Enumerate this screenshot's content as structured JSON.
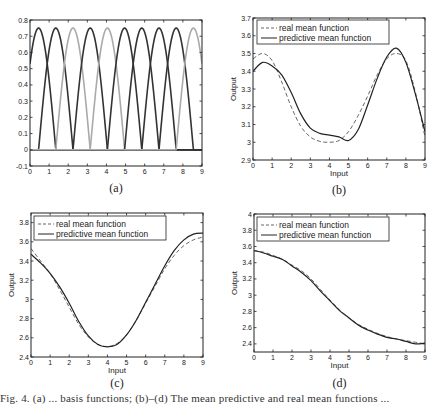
{
  "figure": {
    "caption_partial": "Fig. 4. (a) ... basis functions; (b)–(d) The mean predictive and real mean functions ...",
    "colors": {
      "axis": "#222222",
      "dark_curve": "#333333",
      "light_curve": "#aaaaaa",
      "real": "#666666",
      "pred": "#222222"
    }
  },
  "chart_data": [
    {
      "id": "a",
      "type": "line",
      "panel_label": "(a)",
      "title": "",
      "xlabel": "",
      "ylabel": "",
      "xlim": [
        0,
        9
      ],
      "ylim": [
        -0.1,
        0.8
      ],
      "xticks": [
        0,
        1,
        2,
        3,
        4,
        5,
        6,
        7,
        8,
        9
      ],
      "yticks": [
        -0.1,
        0,
        0.1,
        0.2,
        0.3,
        0.4,
        0.5,
        0.6,
        0.7,
        0.8
      ],
      "ytick_labels": [
        "-0.1",
        "0",
        "0.1",
        "0.2",
        "0.3",
        "0.4",
        "0.5",
        "0.6",
        "0.7",
        "0.8"
      ],
      "grid": false,
      "legend": null,
      "description": "Ten overlapping bell-shaped basis functions (half-cosine bumps), peak 0.75, width ~1.8, zero outside support",
      "series": [
        {
          "name": "basis-1",
          "center": 0.45,
          "peak": 0.75,
          "width": 1.8,
          "shade": "dark"
        },
        {
          "name": "basis-2",
          "center": 1.35,
          "peak": 0.75,
          "width": 1.8,
          "shade": "dark"
        },
        {
          "name": "basis-3",
          "center": 2.25,
          "peak": 0.75,
          "width": 1.8,
          "shade": "light"
        },
        {
          "name": "basis-4",
          "center": 3.15,
          "peak": 0.75,
          "width": 1.8,
          "shade": "dark"
        },
        {
          "name": "basis-5",
          "center": 4.05,
          "peak": 0.75,
          "width": 1.8,
          "shade": "light"
        },
        {
          "name": "basis-6",
          "center": 4.95,
          "peak": 0.75,
          "width": 1.8,
          "shade": "dark"
        },
        {
          "name": "basis-7",
          "center": 5.85,
          "peak": 0.75,
          "width": 1.8,
          "shade": "dark"
        },
        {
          "name": "basis-8",
          "center": 6.75,
          "peak": 0.75,
          "width": 1.8,
          "shade": "dark"
        },
        {
          "name": "basis-9",
          "center": 7.65,
          "peak": 0.75,
          "width": 1.8,
          "shade": "dark"
        },
        {
          "name": "basis-10",
          "center": 8.55,
          "peak": 0.75,
          "width": 1.8,
          "shade": "light"
        }
      ]
    },
    {
      "id": "b",
      "type": "line",
      "panel_label": "(b)",
      "title": "",
      "xlabel": "Input",
      "ylabel": "Output",
      "xlim": [
        0,
        9
      ],
      "ylim": [
        2.9,
        3.7
      ],
      "xticks": [
        0,
        1,
        2,
        3,
        4,
        5,
        6,
        7,
        8,
        9
      ],
      "yticks": [
        2.9,
        3.0,
        3.1,
        3.2,
        3.3,
        3.4,
        3.5,
        3.6,
        3.7
      ],
      "ytick_labels": [
        "2.9",
        "3",
        "3.1",
        "3.2",
        "3.3",
        "3.4",
        "3.5",
        "3.6",
        "3.7"
      ],
      "grid": false,
      "legend": {
        "position": "upper left",
        "entries": [
          "real mean function",
          "predictive mean function"
        ]
      },
      "x": [
        0,
        0.5,
        1,
        1.5,
        2,
        2.5,
        3,
        3.5,
        4,
        4.5,
        5,
        5.5,
        6,
        6.5,
        7,
        7.5,
        8,
        8.5,
        9
      ],
      "series": [
        {
          "name": "real mean function",
          "style": "dashed",
          "values": [
            3.47,
            3.5,
            3.46,
            3.34,
            3.2,
            3.09,
            3.03,
            3.005,
            3.0,
            3.01,
            3.06,
            3.15,
            3.26,
            3.38,
            3.47,
            3.5,
            3.46,
            3.28,
            3.03
          ]
        },
        {
          "name": "predictive mean function",
          "style": "solid",
          "values": [
            3.4,
            3.45,
            3.43,
            3.38,
            3.28,
            3.16,
            3.08,
            3.05,
            3.04,
            3.03,
            3.01,
            3.07,
            3.21,
            3.36,
            3.48,
            3.53,
            3.45,
            3.27,
            3.06
          ]
        }
      ]
    },
    {
      "id": "c",
      "type": "line",
      "panel_label": "(c)",
      "title": "",
      "xlabel": "Input",
      "ylabel": "Output",
      "xlim": [
        0,
        9
      ],
      "ylim": [
        2.4,
        3.9
      ],
      "xticks": [
        0,
        1,
        2,
        3,
        4,
        5,
        6,
        7,
        8,
        9
      ],
      "yticks": [
        2.4,
        2.6,
        2.8,
        3.0,
        3.2,
        3.4,
        3.6,
        3.8
      ],
      "ytick_labels": [
        "2.4",
        "2.6",
        "2.8",
        "3",
        "3.2",
        "3.4",
        "3.6",
        "3.8"
      ],
      "grid": false,
      "legend": {
        "position": "upper left",
        "entries": [
          "real mean function",
          "predictive mean function"
        ]
      },
      "x": [
        0,
        0.5,
        1,
        1.5,
        2,
        2.5,
        3,
        3.5,
        4,
        4.5,
        5,
        5.5,
        6,
        6.5,
        7,
        7.5,
        8,
        8.5,
        9
      ],
      "series": [
        {
          "name": "real mean function",
          "style": "dashed",
          "values": [
            3.53,
            3.4,
            3.27,
            3.1,
            2.92,
            2.74,
            2.61,
            2.53,
            2.51,
            2.54,
            2.63,
            2.78,
            2.96,
            3.14,
            3.32,
            3.46,
            3.56,
            3.62,
            3.65
          ]
        },
        {
          "name": "predictive mean function",
          "style": "solid",
          "values": [
            3.47,
            3.38,
            3.27,
            3.13,
            2.96,
            2.77,
            2.62,
            2.53,
            2.505,
            2.53,
            2.63,
            2.78,
            2.97,
            3.16,
            3.35,
            3.51,
            3.62,
            3.68,
            3.69
          ]
        }
      ]
    },
    {
      "id": "d",
      "type": "line",
      "panel_label": "(d)",
      "title": "",
      "xlabel": "Input",
      "ylabel": "Output",
      "xlim": [
        0,
        9
      ],
      "ylim": [
        2.3,
        4.0
      ],
      "xticks": [
        0,
        1,
        2,
        3,
        4,
        5,
        6,
        7,
        8,
        9
      ],
      "yticks": [
        2.4,
        2.6,
        2.8,
        3.0,
        3.2,
        3.4,
        3.6,
        3.8,
        4.0
      ],
      "ytick_labels": [
        "2.4",
        "2.6",
        "2.8",
        "3",
        "3.2",
        "3.4",
        "3.6",
        "3.8",
        "4"
      ],
      "grid": false,
      "legend": {
        "position": "upper left",
        "entries": [
          "real mean function",
          "predictive mean function"
        ]
      },
      "x": [
        0,
        0.5,
        1,
        1.5,
        2,
        2.5,
        3,
        3.5,
        4,
        4.5,
        5,
        5.5,
        6,
        6.5,
        7,
        7.5,
        8,
        8.5,
        9
      ],
      "series": [
        {
          "name": "real mean function",
          "style": "dashed",
          "values": [
            3.55,
            3.53,
            3.49,
            3.44,
            3.37,
            3.3,
            3.2,
            3.07,
            2.94,
            2.82,
            2.72,
            2.64,
            2.58,
            2.53,
            2.49,
            2.46,
            2.44,
            2.42,
            2.4
          ]
        },
        {
          "name": "predictive mean function",
          "style": "solid",
          "values": [
            3.55,
            3.52,
            3.48,
            3.44,
            3.36,
            3.28,
            3.18,
            3.05,
            2.93,
            2.81,
            2.72,
            2.63,
            2.57,
            2.52,
            2.48,
            2.46,
            2.43,
            2.4,
            2.41
          ]
        }
      ]
    }
  ]
}
